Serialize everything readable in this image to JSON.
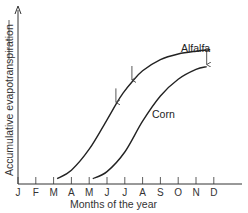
{
  "chart_data": {
    "type": "line",
    "title": "",
    "xlabel": "Months of the year",
    "ylabel": "Accumulative evapotranspiration",
    "categories": [
      "J",
      "F",
      "M",
      "A",
      "M",
      "J",
      "J",
      "A",
      "S",
      "O",
      "N",
      "D"
    ],
    "grid": false,
    "legend": "inline labels",
    "series": [
      {
        "name": "Alfalfa",
        "points": [
          [
            2.2,
            0.01
          ],
          [
            3.0,
            0.07
          ],
          [
            4.0,
            0.22
          ],
          [
            5.0,
            0.43
          ],
          [
            5.5,
            0.54
          ],
          [
            5.9,
            0.62
          ],
          [
            6.4,
            0.7
          ],
          [
            7.0,
            0.78
          ],
          [
            8.0,
            0.86
          ],
          [
            9.0,
            0.9
          ],
          [
            10.0,
            0.92
          ],
          [
            10.8,
            0.93
          ]
        ],
        "arrows_at_month": [
          5.5,
          6.4
        ]
      },
      {
        "name": "Corn",
        "points": [
          [
            4.2,
            0.01
          ],
          [
            5.0,
            0.06
          ],
          [
            6.0,
            0.2
          ],
          [
            7.0,
            0.42
          ],
          [
            8.0,
            0.6
          ],
          [
            9.0,
            0.72
          ],
          [
            10.0,
            0.79
          ],
          [
            10.6,
            0.81
          ]
        ],
        "arrows_at_month": [
          10.6
        ]
      }
    ],
    "xlim": [
      0,
      12
    ],
    "ylim": [
      0,
      1
    ],
    "annotations": [
      "down arrows marking cuttings/harvest"
    ]
  },
  "labels": {
    "alfalfa": "Alfalfa",
    "corn": "Corn",
    "xlabel": "Months of the year",
    "ylabel": "Accumulative evapotranspiration"
  },
  "colors": {
    "line": "#222222",
    "axis": "#333333"
  }
}
